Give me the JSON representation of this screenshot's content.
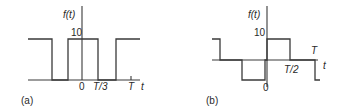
{
  "panels": [
    {
      "id": "a",
      "caption": "(a)",
      "ylabel": "f(t)",
      "amplitude_label": "10",
      "origin_label": "0",
      "xtick_labels": [
        "T/3",
        "T"
      ],
      "xaxis_label": "t",
      "waveform": "rectangular pulse train",
      "levels": [
        0,
        10
      ]
    },
    {
      "id": "b",
      "caption": "(b)",
      "ylabel": "f(t)",
      "amplitude_label": "10",
      "origin_label": "0",
      "xtick_labels": [
        "T/2",
        "T"
      ],
      "xaxis_label": "t",
      "waveform": "bipolar square wave",
      "levels": [
        -10,
        0,
        10
      ]
    }
  ]
}
